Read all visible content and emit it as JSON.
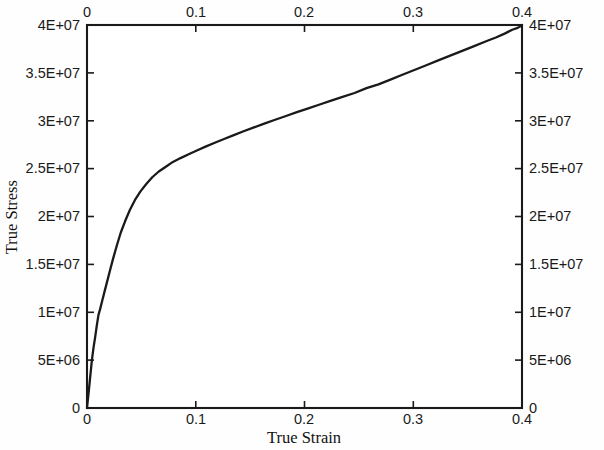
{
  "figure": {
    "background_color": "#fefefe",
    "frame_color": "#1a1a1a",
    "curve_color": "#1a1a1a"
  },
  "axes": {
    "x_title_bottom": "True Strain",
    "y_title_left": "True Stress",
    "x_ticks_bottom": [
      "0",
      "0.1",
      "0.2",
      "0.3",
      "0.4"
    ],
    "x_ticks_top": [
      "0",
      "0.1",
      "0.2",
      "0.3",
      "0.4"
    ],
    "y_ticks_left": [
      "0",
      "5E+06",
      "1E+07",
      "1.5E+07",
      "2E+07",
      "2.5E+07",
      "3E+07",
      "3.5E+07",
      "4E+07"
    ],
    "y_ticks_right": [
      "0",
      "5E+06",
      "1E+07",
      "1.5E+07",
      "2E+07",
      "2.5E+07",
      "3E+07",
      "3.5E+07",
      "4E+07"
    ]
  },
  "chart_data": {
    "type": "line",
    "title": "",
    "subtitle": "",
    "xlabel": "True Strain",
    "ylabel": "True Stress",
    "xlim": [
      0,
      0.4
    ],
    "ylim": [
      0,
      40000000
    ],
    "grid": false,
    "legend": false,
    "legend_position": "none",
    "x_tick_values": [
      0,
      0.1,
      0.2,
      0.3,
      0.4
    ],
    "y_tick_values": [
      0,
      5000000,
      10000000,
      15000000,
      20000000,
      25000000,
      30000000,
      35000000,
      40000000
    ],
    "x_tick_labels": [
      "0",
      "0.1",
      "0.2",
      "0.3",
      "0.4"
    ],
    "y_tick_labels": [
      "0",
      "5E+06",
      "1E+07",
      "1.5E+07",
      "2E+07",
      "2.5E+07",
      "3E+07",
      "3.5E+07",
      "4E+07"
    ],
    "axis_mirrored": true,
    "series": [
      {
        "name": "True stress-strain curve",
        "x": [
          0.0,
          0.0015,
          0.003,
          0.0045,
          0.006,
          0.0075,
          0.009,
          0.0105,
          0.012,
          0.014,
          0.016,
          0.0185,
          0.021,
          0.024,
          0.0275,
          0.031,
          0.035,
          0.0395,
          0.044,
          0.049,
          0.0545,
          0.06,
          0.066,
          0.0725,
          0.079,
          0.086,
          0.0935,
          0.101,
          0.109,
          0.1175,
          0.126,
          0.135,
          0.144,
          0.1535,
          0.163,
          0.173,
          0.183,
          0.193,
          0.2035,
          0.214,
          0.2245,
          0.235,
          0.246,
          0.257,
          0.268,
          0.279,
          0.29,
          0.301,
          0.312,
          0.323,
          0.334,
          0.345,
          0.356,
          0.367,
          0.376,
          0.384,
          0.391,
          0.396,
          0.399,
          0.401
        ],
        "y": [
          0,
          1600000,
          3300000,
          5000000,
          6300000,
          7400000,
          8600000,
          9700000,
          10300000,
          11200000,
          12100000,
          13200000,
          14300000,
          15600000,
          17000000,
          18300000,
          19500000,
          20700000,
          21700000,
          22600000,
          23400000,
          24100000,
          24700000,
          25200000,
          25700000,
          26100000,
          26500000,
          26900000,
          27300000,
          27700000,
          28100000,
          28500000,
          28900000,
          29300000,
          29700000,
          30100000,
          30500000,
          30900000,
          31300000,
          31700000,
          32100000,
          32500000,
          32900000,
          33400000,
          33800000,
          34300000,
          34800000,
          35300000,
          35800000,
          36300000,
          36800000,
          37300000,
          37800000,
          38300000,
          38700000,
          39100000,
          39500000,
          39700000,
          39900000,
          40000000
        ]
      }
    ]
  }
}
